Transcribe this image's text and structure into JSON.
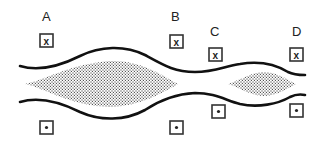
{
  "diagram": {
    "points": [
      {
        "label": "A",
        "top_symbol": "x",
        "bottom_symbol": "•"
      },
      {
        "label": "B",
        "top_symbol": "x",
        "bottom_symbol": "•"
      },
      {
        "label": "C",
        "top_symbol": "x",
        "bottom_symbol": "•"
      },
      {
        "label": "D",
        "top_symbol": "x",
        "bottom_symbol": "•"
      }
    ],
    "top_marker_meaning": "into-page",
    "bottom_marker_meaning": "out-of-page",
    "fill_pattern": "stipple",
    "colors": {
      "line": "#111111",
      "background": "#ffffff",
      "stipple": "#555555"
    }
  }
}
